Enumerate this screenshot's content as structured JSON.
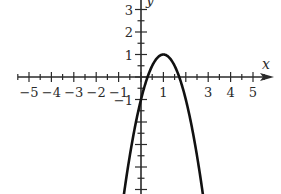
{
  "chart_data": {
    "type": "line",
    "title": "",
    "xlabel": "x",
    "ylabel": "y",
    "xlim": [
      -5.5,
      5.8
    ],
    "ylim": [
      -5.2,
      3.4
    ],
    "x_tick_labels": [
      "-5",
      "-4",
      "-3",
      "-2",
      "-1",
      "1",
      "3",
      "4",
      "5"
    ],
    "x_tick_values": [
      -5,
      -4,
      -3,
      -2,
      -1,
      1,
      3,
      4,
      5
    ],
    "y_tick_labels": [
      "3",
      "2",
      "1",
      "-1"
    ],
    "y_tick_values": [
      3,
      2,
      1,
      -1
    ],
    "minor_tick_step": 0.5,
    "grid": false,
    "series": [
      {
        "name": "f(x) = -2(x-1)^2 + 1",
        "description": "downward-opening parabola with vertex (1, 1), y-intercept -1, x-intercepts ≈ 0.29 and 1.71",
        "vertex": [
          1,
          1
        ],
        "x": [
          -0.76,
          -0.5,
          0,
          0.29,
          0.5,
          1,
          1.5,
          1.71,
          2,
          2.5,
          2.76
        ],
        "values": [
          -5.2,
          -3.5,
          -1,
          0,
          0.5,
          1,
          0.5,
          0,
          -1,
          -3.5,
          -5.2
        ]
      }
    ],
    "colors": {
      "curve": "#111111",
      "axes": "#2a2a2a",
      "background": "#ffffff"
    }
  }
}
